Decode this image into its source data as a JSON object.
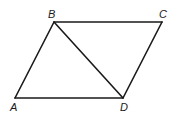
{
  "diagram": {
    "type": "parallelogram-with-diagonal",
    "stroke_color": "#1a1a1a",
    "vertices": {
      "A": {
        "x": 15,
        "y": 98
      },
      "B": {
        "x": 54,
        "y": 22
      },
      "C": {
        "x": 162,
        "y": 22
      },
      "D": {
        "x": 123,
        "y": 98
      }
    },
    "segments": [
      {
        "from": "A",
        "to": "B"
      },
      {
        "from": "B",
        "to": "C"
      },
      {
        "from": "C",
        "to": "D"
      },
      {
        "from": "D",
        "to": "A"
      },
      {
        "from": "B",
        "to": "D"
      }
    ],
    "labels": {
      "A": "A",
      "B": "B",
      "C": "C",
      "D": "D"
    }
  }
}
